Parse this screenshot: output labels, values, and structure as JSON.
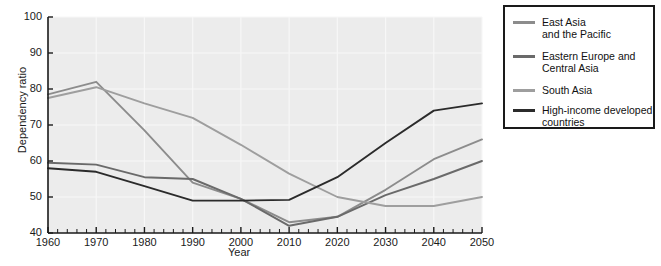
{
  "chart_data": {
    "type": "line",
    "title": "",
    "xlabel": "Year",
    "ylabel": "Dependency ratio",
    "xlim": [
      1960,
      2050
    ],
    "ylim": [
      40,
      100
    ],
    "x_ticks": [
      1960,
      1970,
      1980,
      1990,
      2000,
      2010,
      2020,
      2030,
      2040,
      2050
    ],
    "y_ticks": [
      40,
      50,
      60,
      70,
      80,
      90,
      100
    ],
    "minor_x_tick_interval": 2,
    "grid": true,
    "legend_position": "right-outside",
    "x": [
      1960,
      1970,
      1980,
      1990,
      2000,
      2010,
      2020,
      2030,
      2040,
      2050
    ],
    "series": [
      {
        "name": "East Asia and the Pacific",
        "color": "#8c8c8c",
        "values": [
          78.5,
          82.0,
          68.5,
          54.0,
          49.5,
          43.0,
          44.5,
          52.0,
          60.5,
          66.0
        ]
      },
      {
        "name": "Eastern Europe and Central Asia",
        "color": "#6a6a6a",
        "values": [
          59.5,
          59.0,
          55.5,
          55.0,
          49.5,
          42.0,
          44.5,
          50.5,
          55.0,
          60.0
        ]
      },
      {
        "name": "South Asia",
        "color": "#9e9e9e",
        "values": [
          77.5,
          80.5,
          76.0,
          72.0,
          64.5,
          56.5,
          50.0,
          47.5,
          47.5,
          50.0
        ]
      },
      {
        "name": "High-income developed countries",
        "color": "#2b2b2b",
        "values": [
          58.0,
          57.0,
          53.0,
          49.0,
          49.0,
          49.2,
          55.5,
          65.0,
          74.0,
          76.0
        ]
      }
    ]
  },
  "axes": {
    "y_label": "Dependency ratio",
    "x_label": "Year",
    "y_tick_labels": [
      "100",
      "90",
      "80",
      "70",
      "60",
      "50",
      "40"
    ],
    "x_tick_labels": [
      "1960",
      "1970",
      "1980",
      "1990",
      "2000",
      "2010",
      "2020",
      "2030",
      "2040",
      "2050"
    ]
  },
  "legend": {
    "items": [
      {
        "label": "East Asia\nand the Pacific",
        "color": "#8c8c8c"
      },
      {
        "label": "Eastern Europe and\nCentral Asia",
        "color": "#6a6a6a"
      },
      {
        "label": "South Asia",
        "color": "#9e9e9e"
      },
      {
        "label": "High-income developed\ncountries",
        "color": "#2b2b2b"
      }
    ]
  },
  "style": {
    "plot_background": "#ececec",
    "grid_color": "#f7f7f7",
    "axis_color": "#1a1a1a",
    "text_color": "#1a1a1a"
  }
}
